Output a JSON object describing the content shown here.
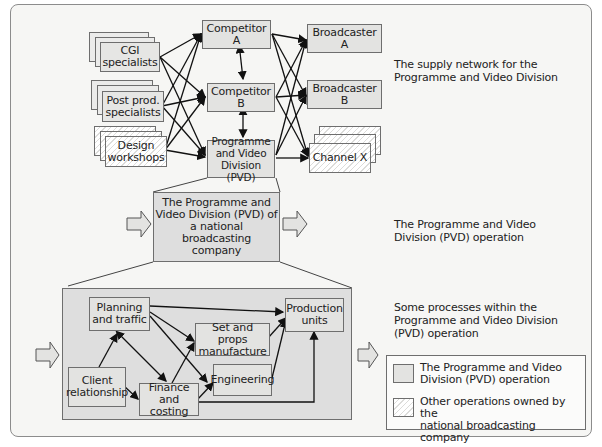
{
  "colors": {
    "pvd_fill": "#e3e3e1",
    "border": "#6e6e6e",
    "background": "#f6f6f4",
    "line": "#111111"
  },
  "supply_network": {
    "suppliers": [
      {
        "line1": "CGI",
        "line2": "specialists",
        "style": "solid"
      },
      {
        "line1": "Post prod.",
        "line2": "specialists",
        "style": "solid"
      },
      {
        "line1": "Design",
        "line2": "workshops",
        "style": "hatched"
      }
    ],
    "competitors": [
      {
        "label": "Competitor A"
      },
      {
        "label": "Competitor B"
      }
    ],
    "pvd": {
      "line1": "Programme",
      "line2": "and Video",
      "line3": "Division (PVD)"
    },
    "customers": [
      {
        "label": "Broadcaster A",
        "style": "solid"
      },
      {
        "label": "Broadcaster B",
        "style": "solid"
      },
      {
        "label": "Channel X",
        "style": "hatched"
      }
    ],
    "caption": {
      "line1": "The supply network for the",
      "line2": "Programme and Video Division"
    }
  },
  "operation": {
    "box": {
      "line1": "The Programme and",
      "line2": "Video Division (PVD) of",
      "line3": "a national broadcasting",
      "line4": "company"
    },
    "caption": {
      "line1": "The Programme and Video",
      "line2": "Division (PVD) operation"
    }
  },
  "processes": {
    "boxes": {
      "planning": {
        "line1": "Planning",
        "line2": "and traffic"
      },
      "set_props": {
        "line1": "Set and props",
        "line2": "manufacture"
      },
      "production": {
        "line1": "Production",
        "line2": "units"
      },
      "client": {
        "line1": "Client",
        "line2": "relationship"
      },
      "finance": {
        "line1": "Finance",
        "line2": "and costing"
      },
      "engineering": {
        "line1": "Engineering"
      }
    },
    "caption": {
      "line1": "Some processes within the",
      "line2": "Programme and Video Division",
      "line3": "(PVD) operation"
    }
  },
  "legend": {
    "items": [
      {
        "line1": "The Programme and Video",
        "line2": "Division (PVD) operation",
        "swatch": "solid"
      },
      {
        "line1": "Other operations owned by the",
        "line2": "national broadcasting company",
        "swatch": "hatched"
      }
    ]
  }
}
